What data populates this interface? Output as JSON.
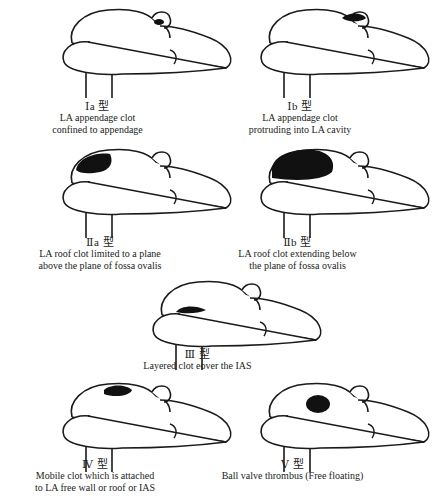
{
  "figure": {
    "panels": [
      {
        "id": "Ia",
        "type_label": "Ⅰa 型",
        "description": [
          "LA appendage clot",
          "confined to appendage"
        ],
        "clot": "appendage-small"
      },
      {
        "id": "Ib",
        "type_label": "Ⅰb 型",
        "description": [
          "LA appendage clot",
          "protruding into LA cavity"
        ],
        "clot": "appendage-protruding"
      },
      {
        "id": "IIa",
        "type_label": "Ⅱa 型",
        "description": [
          "LA roof clot limited to a plane",
          "above the plane of fossa ovalis"
        ],
        "clot": "roof-small"
      },
      {
        "id": "IIb",
        "type_label": "Ⅱb 型",
        "description": [
          "LA roof clot extending below",
          "the plane of fossa ovalis"
        ],
        "clot": "roof-large"
      },
      {
        "id": "III",
        "type_label": "Ⅲ 型",
        "description": [
          "Layered clot eover the IAS"
        ],
        "clot": "layered"
      },
      {
        "id": "IV",
        "type_label": "Ⅳ 型",
        "description": [
          "Mobile clot which is attached",
          "to LA free wall or roof or IAS"
        ],
        "clot": "mobile"
      },
      {
        "id": "V",
        "type_label": "Ⅴ 型",
        "description": [
          "Ball valve thrombus (Free floating)"
        ],
        "clot": "ball"
      }
    ],
    "colors": {
      "line": "#1a1a1a",
      "clot": "#111111",
      "background": "#ffffff"
    }
  }
}
